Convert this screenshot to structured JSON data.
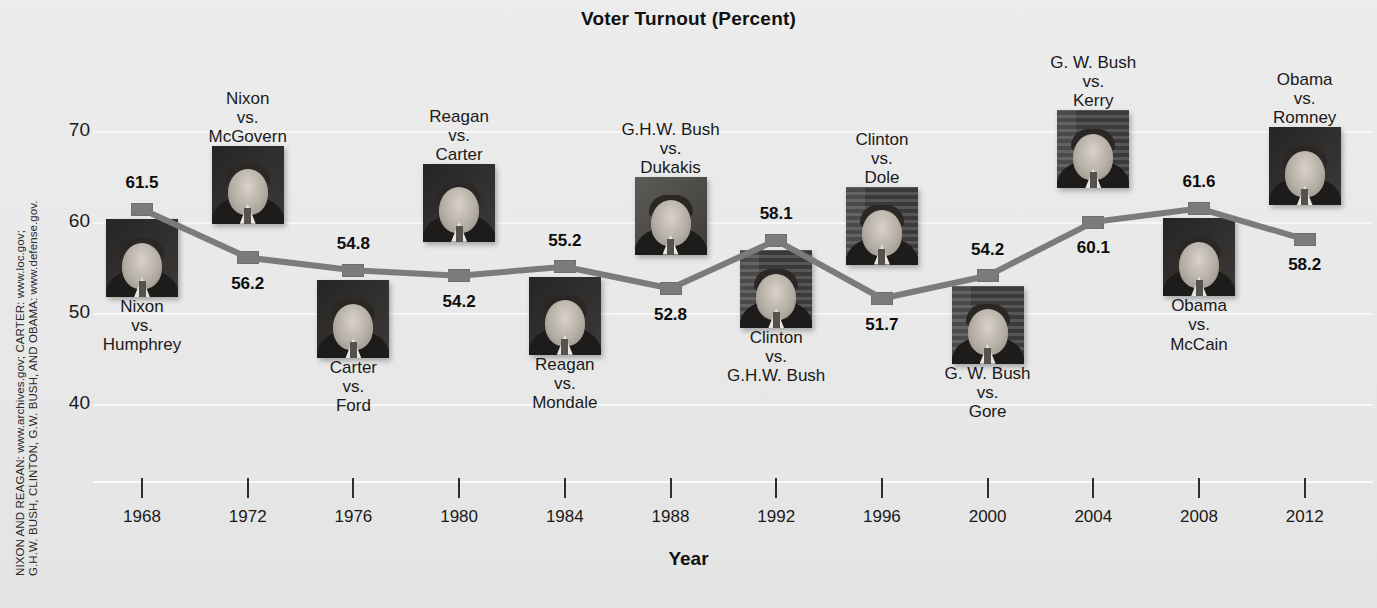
{
  "chart_data": {
    "type": "line",
    "title": "Voter Turnout (Percent)",
    "xlabel": "Year",
    "ylabel": "",
    "ylim": [
      35,
      74
    ],
    "yticks": [
      40,
      50,
      60,
      70
    ],
    "grid": true,
    "legend": "none",
    "categories": [
      "1968",
      "1972",
      "1976",
      "1980",
      "1984",
      "1988",
      "1992",
      "1996",
      "2000",
      "2004",
      "2008",
      "2012"
    ],
    "values": [
      61.5,
      56.2,
      54.8,
      54.2,
      55.2,
      52.8,
      58.1,
      51.7,
      54.2,
      60.1,
      61.6,
      58.2
    ],
    "series": [
      {
        "name": "Voter Turnout (Percent)",
        "values": [
          61.5,
          56.2,
          54.8,
          54.2,
          55.2,
          52.8,
          58.1,
          51.7,
          54.2,
          60.1,
          61.6,
          58.2
        ]
      }
    ],
    "point_labels": [
      "61.5",
      "56.2",
      "54.8",
      "54.2",
      "55.2",
      "52.8",
      "58.1",
      "51.7",
      "54.2",
      "60.1",
      "61.6",
      "58.2"
    ],
    "annotations": [
      "Nixon vs. Humphrey",
      "Nixon vs. McGovern",
      "Carter vs. Ford",
      "Reagan vs. Carter",
      "Reagan vs. Mondale",
      "G.H.W. Bush vs. Dukakis",
      "Clinton vs. G.H.W. Bush",
      "Clinton vs. Dole",
      "G. W. Bush vs. Gore",
      "G. W. Bush vs. Kerry",
      "Obama vs. McCain",
      "Obama vs. Romney"
    ],
    "series_color": "#7b7b7b"
  },
  "axis": {
    "yticks": [
      "70",
      "60",
      "50",
      "40"
    ],
    "xticks": [
      "1968",
      "1972",
      "1976",
      "1980",
      "1984",
      "1988",
      "1992",
      "1996",
      "2000",
      "2004",
      "2008",
      "2012"
    ],
    "xtitle": "Year"
  },
  "points": [
    {
      "year": "1968",
      "value": "61.5",
      "label_pos": "above",
      "c1": "Nixon",
      "c2": "vs.",
      "c3": "Humphrey",
      "cap_pos": "below",
      "photo": "nixon-1968-photo",
      "photo_style": "dark"
    },
    {
      "year": "1972",
      "value": "56.2",
      "label_pos": "below",
      "c1": "Nixon",
      "c2": "vs.",
      "c3": "McGovern",
      "cap_pos": "above",
      "photo": "nixon-1972-photo",
      "photo_style": "dark"
    },
    {
      "year": "1976",
      "value": "54.8",
      "label_pos": "above",
      "c1": "Carter",
      "c2": "vs.",
      "c3": "Ford",
      "cap_pos": "below",
      "photo": "carter-1976-photo",
      "photo_style": "dark"
    },
    {
      "year": "1980",
      "value": "54.2",
      "label_pos": "below",
      "c1": "Reagan",
      "c2": "vs.",
      "c3": "Carter",
      "cap_pos": "above",
      "photo": "reagan-1980-photo",
      "photo_style": "dark"
    },
    {
      "year": "1984",
      "value": "55.2",
      "label_pos": "above",
      "c1": "Reagan",
      "c2": "vs.",
      "c3": "Mondale",
      "cap_pos": "below",
      "photo": "reagan-1984-photo",
      "photo_style": "dark"
    },
    {
      "year": "1988",
      "value": "52.8",
      "label_pos": "below",
      "c1": "G.H.W. Bush",
      "c2": "vs.",
      "c3": "Dukakis",
      "cap_pos": "above",
      "photo": "ghw-bush-1988-photo",
      "photo_style": "lite"
    },
    {
      "year": "1992",
      "value": "58.1",
      "label_pos": "above",
      "c1": "Clinton",
      "c2": "vs.",
      "c3": "G.H.W. Bush",
      "cap_pos": "below",
      "photo": "clinton-1992-photo",
      "photo_style": "flag"
    },
    {
      "year": "1996",
      "value": "51.7",
      "label_pos": "below",
      "c1": "Clinton",
      "c2": "vs.",
      "c3": "Dole",
      "cap_pos": "above",
      "photo": "clinton-1996-photo",
      "photo_style": "flag"
    },
    {
      "year": "2000",
      "value": "54.2",
      "label_pos": "above",
      "c1": "G. W. Bush",
      "c2": "vs.",
      "c3": "Gore",
      "cap_pos": "below",
      "photo": "gw-bush-2000-photo",
      "photo_style": "flag"
    },
    {
      "year": "2004",
      "value": "60.1",
      "label_pos": "below",
      "c1": "G. W. Bush",
      "c2": "vs.",
      "c3": "Kerry",
      "cap_pos": "above",
      "photo": "gw-bush-2004-photo",
      "photo_style": "flag"
    },
    {
      "year": "2008",
      "value": "61.6",
      "label_pos": "above",
      "c1": "Obama",
      "c2": "vs.",
      "c3": "McCain",
      "cap_pos": "below",
      "photo": "obama-2008-photo",
      "photo_style": "dark"
    },
    {
      "year": "2012",
      "value": "58.2",
      "label_pos": "below",
      "c1": "Obama",
      "c2": "vs.",
      "c3": "Romney",
      "cap_pos": "above",
      "photo": "obama-2012-photo",
      "photo_style": "dark"
    }
  ],
  "source_credit": {
    "line1": "NIXON AND REAGAN: www.archives.gov; CARTER: www.loc.gov;",
    "line2": "G.H.W. BUSH, CLINTON, G.W. BUSH, AND OBAMA: www.defense.gov."
  }
}
